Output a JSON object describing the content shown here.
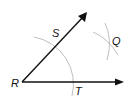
{
  "diagram": {
    "points": {
      "R": {
        "label": "R"
      },
      "S": {
        "label": "S"
      },
      "T": {
        "label": "T"
      },
      "Q": {
        "label": "Q"
      }
    },
    "rays": [
      {
        "name": "ray-RS",
        "from": "R",
        "through": "S",
        "arrow": true
      },
      {
        "name": "ray-RT",
        "from": "R",
        "through": "T",
        "arrow": true
      }
    ],
    "arcs": [
      {
        "name": "arc-centered-R",
        "center": "R",
        "intersects": [
          "S",
          "T"
        ]
      },
      {
        "name": "arc-from-S",
        "center": "S",
        "intersects": [
          "Q"
        ]
      },
      {
        "name": "arc-from-T",
        "center": "T",
        "intersects": [
          "Q"
        ]
      }
    ],
    "colors": {
      "ray": "#111111",
      "arc": "#b8b8b8",
      "text": "#111111"
    }
  }
}
